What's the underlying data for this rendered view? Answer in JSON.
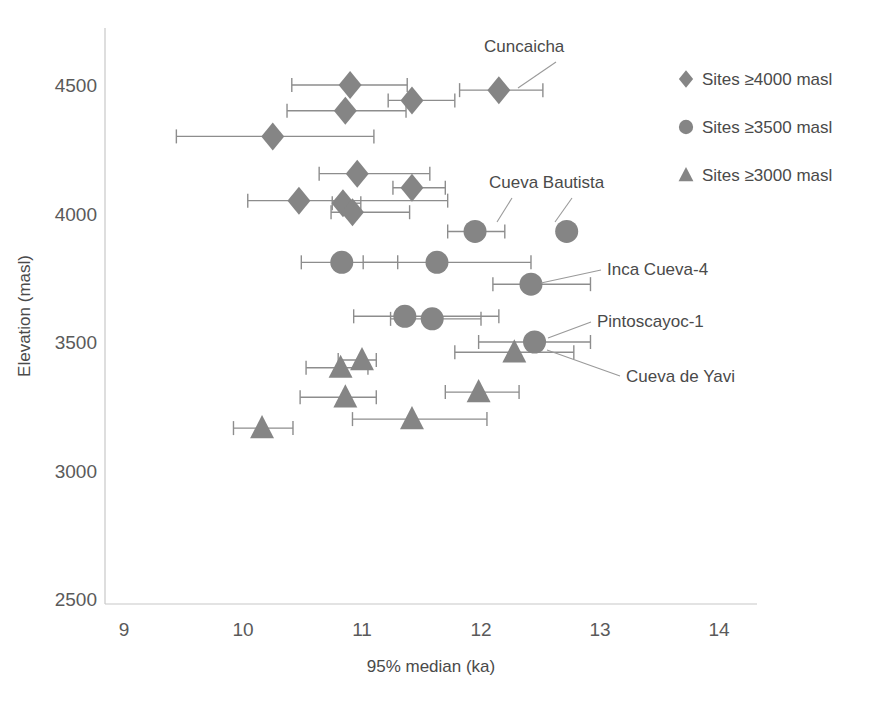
{
  "chart_data": {
    "type": "scatter",
    "title": "",
    "xlabel": "95% median (ka)",
    "ylabel": "Elevation (masl)",
    "xlim": [
      9,
      14
    ],
    "ylim": [
      2500,
      4600
    ],
    "xticks": [
      9,
      10,
      11,
      12,
      13,
      14
    ],
    "yticks": [
      2500,
      3000,
      3500,
      4000,
      4500
    ],
    "xtick_labels": [
      "9",
      "10",
      "11",
      "12",
      "13",
      "14"
    ],
    "ytick_labels": [
      "2500",
      "3000",
      "3500",
      "4000",
      "4500"
    ],
    "grid": false,
    "legend_position": "upper right",
    "marker_color": "#858585",
    "errorbar_color": "#8d8d8d",
    "series": [
      {
        "name": "Sites ≥4000 masl",
        "marker": "diamond",
        "color": "#858585",
        "points": [
          {
            "x": 10.9,
            "y": 4500,
            "xerr_low": 10.41,
            "xerr_high": 11.38
          },
          {
            "x": 10.86,
            "y": 4400,
            "xerr_low": 10.37,
            "xerr_high": 11.37
          },
          {
            "x": 11.42,
            "y": 4440,
            "xerr_low": 11.22,
            "xerr_high": 11.78
          },
          {
            "x": 12.15,
            "y": 4480,
            "xerr_low": 11.82,
            "xerr_high": 12.52,
            "label": "Cuncaicha"
          },
          {
            "x": 10.25,
            "y": 4300,
            "xerr_low": 9.44,
            "xerr_high": 11.1
          },
          {
            "x": 10.96,
            "y": 4155,
            "xerr_low": 10.64,
            "xerr_high": 11.57
          },
          {
            "x": 11.42,
            "y": 4100,
            "xerr_low": 11.26,
            "xerr_high": 11.7
          },
          {
            "x": 10.47,
            "y": 4050,
            "xerr_low": 10.04,
            "xerr_high": 11.72
          },
          {
            "x": 10.84,
            "y": 4040,
            "xerr_low": 10.75,
            "xerr_high": 10.99
          },
          {
            "x": 10.92,
            "y": 4005,
            "xerr_low": 10.74,
            "xerr_high": 11.4
          }
        ]
      },
      {
        "name": "Sites ≥3500 masl",
        "marker": "circle",
        "color": "#858585",
        "points": [
          {
            "x": 11.95,
            "y": 3930,
            "xerr_low": 11.72,
            "xerr_high": 12.2,
            "label": "Cueva Bautista"
          },
          {
            "x": 12.72,
            "y": 3930,
            "label": "Cueva Bautista"
          },
          {
            "x": 10.83,
            "y": 3810,
            "xerr_low": 10.49,
            "xerr_high": 11.3
          },
          {
            "x": 11.63,
            "y": 3810,
            "xerr_low": 11.01,
            "xerr_high": 12.42
          },
          {
            "x": 12.42,
            "y": 3725,
            "xerr_low": 12.1,
            "xerr_high": 12.92,
            "label": "Inca Cueva-4"
          },
          {
            "x": 11.36,
            "y": 3600,
            "xerr_low": 10.93,
            "xerr_high": 12.15
          },
          {
            "x": 11.59,
            "y": 3590,
            "xerr_low": 11.24,
            "xerr_high": 12.0
          },
          {
            "x": 12.45,
            "y": 3500,
            "xerr_low": 11.98,
            "xerr_high": 12.92,
            "label": "Pintoscayoc-1"
          }
        ]
      },
      {
        "name": "Sites ≥3000 masl",
        "marker": "triangle",
        "color": "#858585",
        "points": [
          {
            "x": 12.28,
            "y": 3460,
            "xerr_low": 11.78,
            "xerr_high": 12.78,
            "label": "Cueva de Yavi"
          },
          {
            "x": 10.82,
            "y": 3400,
            "xerr_low": 10.53,
            "xerr_high": 11.05
          },
          {
            "x": 11.0,
            "y": 3430,
            "xerr_low": 10.8,
            "xerr_high": 11.12
          },
          {
            "x": 10.86,
            "y": 3285,
            "xerr_low": 10.48,
            "xerr_high": 11.12
          },
          {
            "x": 11.98,
            "y": 3305,
            "xerr_low": 11.7,
            "xerr_high": 12.32
          },
          {
            "x": 10.16,
            "y": 3165,
            "xerr_low": 9.92,
            "xerr_high": 10.42
          },
          {
            "x": 11.42,
            "y": 3200,
            "xerr_low": 10.92,
            "xerr_high": 12.05
          }
        ]
      }
    ],
    "annotations": [
      {
        "label": "Cuncaicha",
        "text_x": 484,
        "text_y": 52,
        "leader": [
          [
            556,
            62
          ],
          [
            518,
            88
          ]
        ]
      },
      {
        "label": "Cueva Bautista",
        "text_x": 489,
        "text_y": 188,
        "leader": [
          [
            512,
            198
          ],
          [
            497,
            222
          ]
        ]
      },
      {
        "label": "Cueva Bautista",
        "text_x": 489,
        "text_y": 188,
        "leader": [
          [
            572,
            198
          ],
          [
            555,
            222
          ]
        ]
      },
      {
        "label": "Inca Cueva-4",
        "text_x": 607,
        "text_y": 275,
        "leader": [
          [
            601,
            270
          ],
          [
            541,
            283
          ]
        ]
      },
      {
        "label": "Pintoscayoc-1",
        "text_x": 597,
        "text_y": 327,
        "leader": [
          [
            591,
            322
          ],
          [
            548,
            338
          ]
        ]
      },
      {
        "label": "Cueva de Yavi",
        "text_x": 626,
        "text_y": 382,
        "leader": [
          [
            620,
            376
          ],
          [
            547,
            350
          ]
        ]
      }
    ]
  },
  "legend": {
    "items": [
      {
        "label": "Sites ≥4000 masl",
        "marker": "diamond"
      },
      {
        "label": "Sites ≥3500 masl",
        "marker": "circle"
      },
      {
        "label": "Sites ≥3000 masl",
        "marker": "triangle"
      }
    ]
  }
}
